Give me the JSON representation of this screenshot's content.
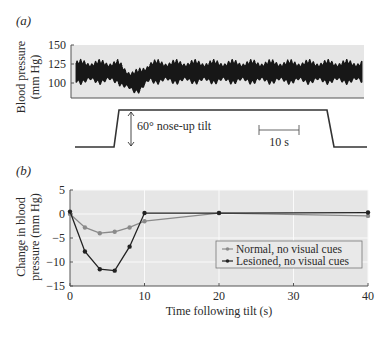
{
  "panel_a": {
    "label": "(a)",
    "ylabel_line1": "Blood pressure",
    "ylabel_line2": "(mm Hg)",
    "yticks": [
      "150",
      "125",
      "100"
    ],
    "tilt_label": "60° nose-up tilt",
    "scale_label": "10 s"
  },
  "panel_b": {
    "label": "(b)",
    "ylabel_line1": "Change in blood",
    "ylabel_line2": "pressure (mm Hg)",
    "xlabel": "Time following tilt (s)",
    "yticks": [
      "5",
      "0",
      "−5",
      "−10",
      "−15"
    ],
    "xticks": [
      "0",
      "10",
      "20",
      "30",
      "40"
    ],
    "legend": [
      "Normal, no visual cues",
      "Lesioned, no visual cues"
    ]
  },
  "chart_data": [
    {
      "type": "line",
      "title": "(a) Blood pressure trace during 60° nose-up tilt",
      "ylabel": "Blood pressure (mm Hg)",
      "yticks": [
        100,
        125,
        150
      ],
      "ylim": [
        85,
        150
      ],
      "annotations": [
        "60° nose-up tilt",
        "10 s"
      ],
      "description": "Oscillating blood pressure trace (~100–135 mm Hg) with a transient dip to ~88 mm Hg shortly after tilt onset, then recovery"
    },
    {
      "type": "line",
      "title": "(b)",
      "xlabel": "Time following tilt (s)",
      "ylabel": "Change in blood pressure (mm Hg)",
      "xlim": [
        0,
        40
      ],
      "ylim": [
        -15,
        5
      ],
      "xticks": [
        0,
        10,
        20,
        30,
        40
      ],
      "yticks": [
        5,
        0,
        -5,
        -10,
        -15
      ],
      "grid": true,
      "legend_position": "lower right",
      "series": [
        {
          "name": "Normal, no visual cues",
          "color": "#8a8a8a",
          "x": [
            0,
            2,
            4,
            6,
            8,
            10,
            20,
            40
          ],
          "y": [
            0,
            -2.8,
            -4,
            -3.7,
            -2.8,
            -1.5,
            0.2,
            -0.4
          ]
        },
        {
          "name": "Lesioned, no visual cues",
          "color": "#222222",
          "x": [
            0,
            2,
            4,
            6,
            8,
            10,
            20,
            40
          ],
          "y": [
            0.5,
            -7.8,
            -11.5,
            -11.8,
            -6.8,
            0.2,
            0.2,
            0.3
          ]
        }
      ]
    }
  ]
}
